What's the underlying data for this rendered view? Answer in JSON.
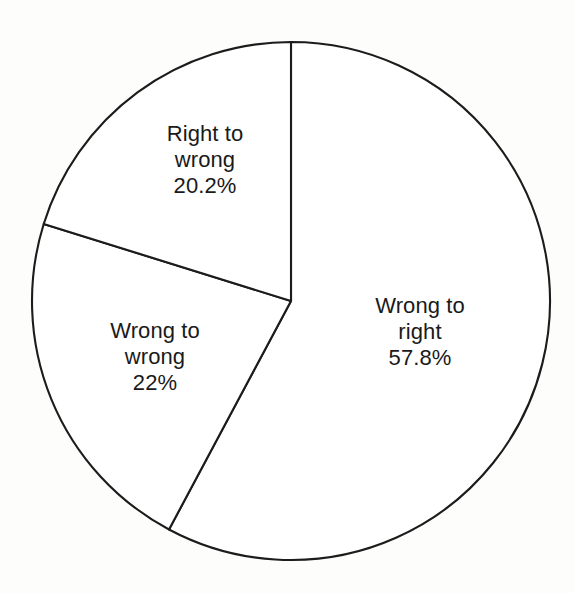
{
  "chart_data": {
    "type": "pie",
    "title": "",
    "subtitle": "",
    "xlabel": "",
    "ylabel": "",
    "legend_position": "none",
    "grid": false,
    "units": "percent",
    "total": 100,
    "start_angle_deg": 0,
    "direction": "clockwise",
    "slices": [
      {
        "name": "wrong-to-right",
        "label_line1": "Wrong to",
        "label_line2": "right",
        "value_text": "57.8%",
        "value": 57.8,
        "angle_deg": 208.1,
        "start_deg": 0,
        "end_deg": 208.1,
        "fill": "#ffffff",
        "stroke": "#1c1c1c",
        "label_x": 420,
        "label_y": 332
      },
      {
        "name": "wrong-to-wrong",
        "label_line1": "Wrong to",
        "label_line2": "wrong",
        "value_text": "22%",
        "value": 22,
        "angle_deg": 79.2,
        "start_deg": 208.1,
        "end_deg": 287.3,
        "fill": "#ffffff",
        "stroke": "#1c1c1c",
        "label_x": 155,
        "label_y": 357
      },
      {
        "name": "right-to-wrong",
        "label_line1": "Right to",
        "label_line2": "wrong",
        "value_text": "20.2%",
        "value": 20.2,
        "angle_deg": 72.7,
        "start_deg": 287.3,
        "end_deg": 360,
        "fill": "#ffffff",
        "stroke": "#1c1c1c",
        "label_x": 205,
        "label_y": 160
      }
    ],
    "geometry": {
      "center_x": 291,
      "center_y": 301,
      "radius": 259
    },
    "background_color": "#fdfdfc",
    "stroke_color": "#1c1c1c",
    "text_color": "#1a1a1a"
  }
}
